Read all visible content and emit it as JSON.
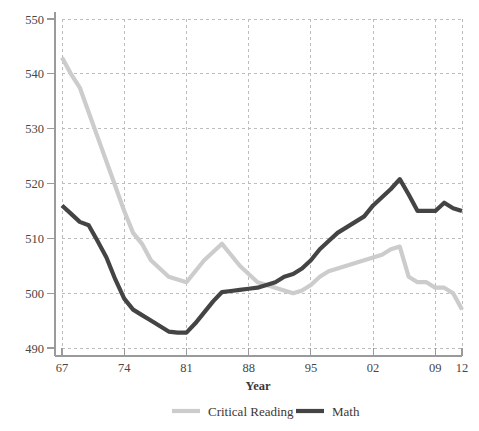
{
  "chart_data": {
    "type": "line",
    "title": "",
    "xlabel": "Year",
    "ylabel": "",
    "xlim": [
      1967,
      2012
    ],
    "ylim": [
      488,
      551
    ],
    "grid": true,
    "legend_position": "bottom",
    "y_ticks": [
      490,
      500,
      510,
      520,
      530,
      540,
      550
    ],
    "y_tick_labels": [
      "490",
      "500",
      "510",
      "520",
      "530",
      "540",
      "550"
    ],
    "x_ticks": [
      1967,
      1974,
      1981,
      1988,
      1995,
      2002,
      2009,
      2012
    ],
    "x_tick_labels": [
      "67",
      "74",
      "81",
      "88",
      "95",
      "02",
      "09",
      "12"
    ],
    "x": [
      1967,
      1968,
      1969,
      1970,
      1971,
      1972,
      1973,
      1974,
      1975,
      1976,
      1977,
      1978,
      1979,
      1980,
      1981,
      1982,
      1983,
      1984,
      1985,
      1986,
      1987,
      1988,
      1989,
      1990,
      1991,
      1992,
      1993,
      1994,
      1995,
      1996,
      1997,
      1998,
      1999,
      2000,
      2001,
      2002,
      2003,
      2004,
      2005,
      2006,
      2007,
      2008,
      2009,
      2010,
      2011,
      2012
    ],
    "series": [
      {
        "name": "Critical Reading",
        "color": "#cccccc",
        "width": 4.2,
        "values": [
          543,
          540,
          537.5,
          533,
          528.5,
          524,
          519.5,
          515,
          511,
          509,
          506,
          504.5,
          503,
          502.5,
          502,
          504,
          506,
          507.5,
          509,
          507,
          505,
          503.5,
          502,
          501.5,
          501,
          500.5,
          500,
          500.5,
          501.5,
          503,
          504,
          504.5,
          505,
          505.5,
          506,
          506.5,
          507,
          508,
          508.5,
          503,
          502,
          502,
          501,
          501,
          500,
          497
        ]
      },
      {
        "name": "Math",
        "color": "#444444",
        "width": 4.2,
        "values": [
          516,
          514.5,
          513,
          512.4,
          509.5,
          506.5,
          502.5,
          499,
          497,
          496,
          495,
          494,
          493,
          492.8,
          492.8,
          494.5,
          496.5,
          498.5,
          500.2,
          500.4,
          500.6,
          500.8,
          501,
          501.5,
          502,
          503,
          503.5,
          504.5,
          506,
          508,
          509.5,
          511,
          512,
          513,
          514,
          516,
          517.5,
          519,
          520.8,
          518,
          515,
          515,
          515,
          516.5,
          515.5,
          515
        ]
      }
    ]
  },
  "legend": [
    {
      "label": "Critical Reading",
      "color": "#cccccc"
    },
    {
      "label": "Math",
      "color": "#444444"
    }
  ],
  "axes": {
    "x_axis_title": "Year",
    "axis_color": "#9a9a9a",
    "grid_color": "#bdbdbd"
  }
}
